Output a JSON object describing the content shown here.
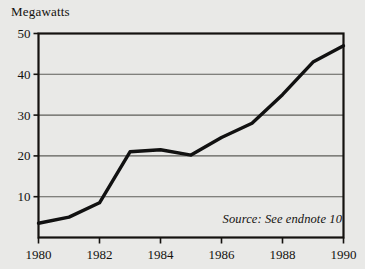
{
  "figure": {
    "background_color": "#e9e9e7",
    "ink_color": "#14120f",
    "gridline_color": "#5d5d58",
    "series_color": "#111111"
  },
  "axis_title": {
    "y": "Megawatts"
  },
  "annotation": {
    "source_note": "Source: See endnote 10"
  },
  "chart_data": {
    "type": "line",
    "title": "",
    "subtitle": "",
    "xlabel": "",
    "ylabel": "Megawatts",
    "xlim": [
      1980,
      1990
    ],
    "ylim": [
      0,
      50
    ],
    "grid": true,
    "legend": "none",
    "x_tick_labels": [
      "1980",
      "1982",
      "1984",
      "1986",
      "1988",
      "1990"
    ],
    "x_ticks": [
      1980,
      1982,
      1984,
      1986,
      1988,
      1990
    ],
    "y_tick_labels": [
      "10",
      "20",
      "30",
      "40",
      "50"
    ],
    "y_ticks": [
      10,
      20,
      30,
      40,
      50
    ],
    "x": [
      1980,
      1981,
      1982,
      1983,
      1984,
      1985,
      1986,
      1987,
      1988,
      1989,
      1990
    ],
    "series": [
      {
        "name": "Megawatts",
        "values": [
          3.5,
          5.0,
          8.5,
          21.0,
          21.5,
          20.2,
          24.5,
          28.0,
          35.0,
          43.0,
          47.0
        ]
      }
    ],
    "annotations": [
      {
        "text": "Source: See endnote 10",
        "x": 1988.3,
        "y": 5.0
      }
    ]
  }
}
